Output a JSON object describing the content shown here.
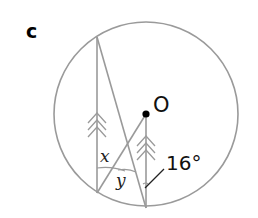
{
  "figure": {
    "part_label": "c",
    "center_label": "O",
    "angle_labels": {
      "x": "x",
      "y": "y",
      "given": "16°"
    },
    "given_angle_degrees": 16,
    "colors": {
      "lines": "#9a9a9a",
      "center_point": "#000000",
      "text": "#111111"
    },
    "elements": {
      "circle": {
        "cx": 146,
        "cy": 114,
        "r": 92
      },
      "parallel_chord_left": {
        "x1": 97,
        "y1": 37,
        "x2": 97,
        "y2": 193
      },
      "diagonal_chord": {
        "x1": 97,
        "y1": 37,
        "x2": 146,
        "y2": 208
      },
      "radius_to_left_chord_end": {
        "x1": 146,
        "y1": 114,
        "x2": 97,
        "y2": 193
      },
      "radius_vertical": {
        "x1": 146,
        "y1": 114,
        "x2": 146,
        "y2": 208
      }
    }
  }
}
